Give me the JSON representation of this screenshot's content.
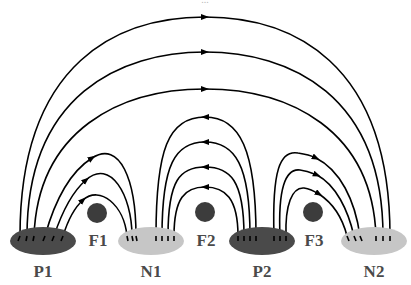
{
  "title_fragment": "...",
  "colors": {
    "positive": "#4a4a4a",
    "negative": "#c6c6c6",
    "floating": "#3c3c3c",
    "field_line": "#000000",
    "label": "#4a4a4a"
  },
  "electrodes": [
    {
      "id": "P1",
      "label": "P1",
      "type": "positive"
    },
    {
      "id": "N1",
      "label": "N1",
      "type": "negative"
    },
    {
      "id": "P2",
      "label": "P2",
      "type": "positive"
    },
    {
      "id": "N2",
      "label": "N2",
      "type": "negative"
    }
  ],
  "floating_electrodes": [
    {
      "id": "F1",
      "label": "F1"
    },
    {
      "id": "F2",
      "label": "F2"
    },
    {
      "id": "F3",
      "label": "F3"
    }
  ],
  "field_line_groups": [
    {
      "from": "P1",
      "to": "N1",
      "count": 3,
      "arrow_direction": "toward N1"
    },
    {
      "from": "P2",
      "to": "N1",
      "count": 4,
      "arrow_direction": "toward N1"
    },
    {
      "from": "P2",
      "to": "N2",
      "count": 3,
      "arrow_direction": "toward N2"
    },
    {
      "from": "P1",
      "to": "N2",
      "count": 3,
      "arrow_direction": "toward N2"
    }
  ]
}
